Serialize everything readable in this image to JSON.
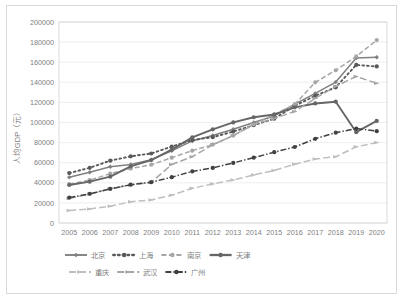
{
  "chart_data": {
    "type": "line",
    "title": "",
    "xlabel": "",
    "ylabel": "人均GDP（元）",
    "ylim": [
      0,
      200000
    ],
    "ytick_step": 20000,
    "yticks": [
      "0",
      "20000",
      "40000",
      "60000",
      "80000",
      "100000",
      "120000",
      "140000",
      "160000",
      "180000",
      "200000"
    ],
    "grid": true,
    "legend_position": "bottom",
    "categories": [
      "2005",
      "2006",
      "2007",
      "2008",
      "2009",
      "2010",
      "2011",
      "2012",
      "2013",
      "2014",
      "2015",
      "2016",
      "2017",
      "2018",
      "2019",
      "2020"
    ],
    "series": [
      {
        "name": "北京",
        "color": "#808080",
        "style": "solid",
        "marker": "diamond",
        "values": [
          45444,
          50467,
          56044,
          58204,
          63029,
          71938,
          81658,
          87091,
          93213,
          99995,
          106497,
          118198,
          128994,
          140211,
          164220,
          164889
        ]
      },
      {
        "name": "上海",
        "color": "#595959",
        "style": "dotted",
        "marker": "circle",
        "values": [
          49649,
          54927,
          62041,
          66367,
          69165,
          76074,
          82560,
          85373,
          90993,
          97370,
          103796,
          116562,
          126634,
          135000,
          157279,
          155768
        ]
      },
      {
        "name": "南京",
        "color": "#a6a6a6",
        "style": "dashed",
        "marker": "circle",
        "values": [
          38680,
          42685,
          49091,
          54156,
          57960,
          65000,
          72000,
          78000,
          87000,
          98000,
          108000,
          118000,
          140000,
          152000,
          165700,
          182000
        ]
      },
      {
        "name": "天津",
        "color": "#666666",
        "style": "solid-thick",
        "marker": "circle",
        "values": [
          37796,
          41163,
          46122,
          56432,
          62574,
          72994,
          85213,
          93173,
          100105,
          105231,
          107960,
          115053,
          118944,
          120711,
          90371,
          101614
        ]
      },
      {
        "name": "重庆",
        "color": "#bfbfbf",
        "style": "dashed-long",
        "marker": "arrow",
        "values": [
          12437,
          14011,
          16715,
          21100,
          22920,
          27596,
          34500,
          38914,
          42795,
          47859,
          52321,
          58502,
          63689,
          65933,
          75828,
          80000
        ]
      },
      {
        "name": "武汉",
        "color": "#a6a6a6",
        "style": "dashed-long",
        "marker": "arrow",
        "values": [
          24300,
          28900,
          34200,
          37800,
          40500,
          58200,
          66000,
          77800,
          87000,
          98000,
          104000,
          111000,
          124000,
          136000,
          145800,
          139000
        ]
      },
      {
        "name": "广州",
        "color": "#404040",
        "style": "dash-dot",
        "marker": "circle",
        "values": [
          25300,
          29000,
          33900,
          38100,
          40600,
          45600,
          51300,
          54800,
          59800,
          65000,
          70500,
          75600,
          83800,
          89900,
          94000,
          91400
        ]
      }
    ]
  },
  "legend": {
    "rows": [
      [
        "北京",
        "上海",
        "南京",
        "天津"
      ],
      [
        "重庆",
        "武汉",
        "广州"
      ]
    ]
  }
}
